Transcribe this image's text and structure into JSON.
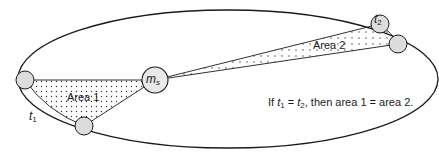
{
  "diagram": {
    "sun": {
      "label_main": "m",
      "label_sub": "s"
    },
    "areas": [
      {
        "label": "Area 1"
      },
      {
        "label": "Area 2"
      }
    ],
    "times": [
      {
        "var": "t",
        "sub": "1"
      },
      {
        "var": "t",
        "sub": "2"
      }
    ],
    "caption": {
      "prefix": "If ",
      "t1_var": "t",
      "t1_sub": "1",
      "equals": " = ",
      "t2_var": "t",
      "t2_sub": "2",
      "suffix": ", then area 1 = area 2."
    },
    "colors": {
      "line": "#1a1a1a",
      "body_fill": "#dcdcdc",
      "dot": "#333333",
      "background": "#ffffff"
    }
  }
}
